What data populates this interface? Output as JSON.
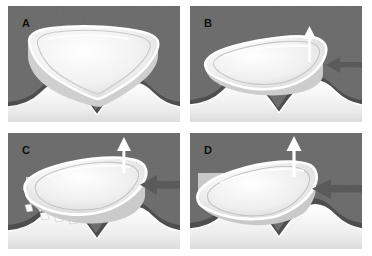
{
  "figure": {
    "kind": "four-panel-medical-illustration",
    "width": 372,
    "height": 256,
    "background_color": "#ffffff",
    "panel_background_color": "#6a6a6a",
    "bone_color": "#f7f7f7",
    "implant_fill_color": "#f2f2f2",
    "socket_band_color": "#4e4e4e",
    "arrow_white_color": "#ffffff",
    "arrow_gray_color": "#5a5a5a",
    "label_color": "#111111"
  },
  "panels": [
    {
      "id": "A",
      "label": "A",
      "caption": "Wedge seated level in concave socket, no displacement",
      "tilt_degrees": 0,
      "has_up_arrow": false,
      "has_left_arrow": false,
      "has_graft_particles": false
    },
    {
      "id": "B",
      "label": "B",
      "caption": "Wedge tilted, upward and leftward force applied",
      "tilt_degrees": 12,
      "has_up_arrow": true,
      "has_left_arrow": true,
      "has_graft_particles": false,
      "up_arrow_size": "small",
      "left_arrow_size": "small"
    },
    {
      "id": "C",
      "label": "C",
      "caption": "Wedge elevated with bone graft particles packed beneath",
      "tilt_degrees": 16,
      "has_up_arrow": true,
      "has_left_arrow": true,
      "has_graft_particles": true,
      "up_arrow_size": "medium",
      "left_arrow_size": "large"
    },
    {
      "id": "D",
      "label": "D",
      "caption": "Wedge fully rotated and displaced, graft resorbed",
      "tilt_degrees": 20,
      "has_up_arrow": true,
      "has_left_arrow": true,
      "has_graft_particles": false,
      "up_arrow_size": "large",
      "left_arrow_size": "large"
    }
  ]
}
